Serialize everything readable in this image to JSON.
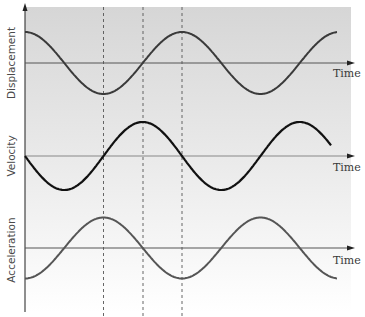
{
  "figure": {
    "panels": [
      {
        "ylabel": "Displacement",
        "xlabel": "Time",
        "phase": "cos",
        "color": "#3a3a3a"
      },
      {
        "ylabel": "Velocity",
        "xlabel": "Time",
        "phase": "-sin",
        "color": "#111111"
      },
      {
        "ylabel": "Acceleration",
        "xlabel": "Time",
        "phase": "-cos",
        "color": "#555555"
      }
    ],
    "colors": {
      "background_top": "#d8d8d8",
      "background_bottom": "#ffffff",
      "axis": "#444444",
      "dashed_guides": "#555555"
    }
  },
  "chart_data": {
    "type": "line",
    "title": "",
    "xlabel": "Time",
    "series": [
      {
        "name": "Displacement",
        "function": "cos(t)",
        "x_periods": 2,
        "start": "max",
        "values_at_quarter_periods": [
          1,
          0,
          -1,
          0,
          1,
          0,
          -1,
          0,
          1
        ]
      },
      {
        "name": "Velocity",
        "function": "-sin(t)",
        "x_periods": 2,
        "start": "zero",
        "values_at_quarter_periods": [
          0,
          -1,
          0,
          1,
          0,
          -1,
          0,
          1,
          0
        ]
      },
      {
        "name": "Acceleration",
        "function": "-cos(t)",
        "x_periods": 2,
        "start": "min",
        "values_at_quarter_periods": [
          -1,
          0,
          1,
          0,
          -1,
          0,
          1,
          0,
          -1
        ]
      }
    ],
    "guides": [
      {
        "type": "vertical-dashed",
        "at_quarter_period": 2,
        "note": "displacement min, velocity zero, acceleration max"
      },
      {
        "type": "vertical-dashed",
        "at_quarter_period": 3,
        "note": "displacement zero, velocity max, acceleration zero"
      },
      {
        "type": "vertical-dashed",
        "at_quarter_period": 4,
        "note": "displacement max, velocity zero, acceleration min"
      }
    ],
    "grid": false,
    "legend": "none"
  }
}
